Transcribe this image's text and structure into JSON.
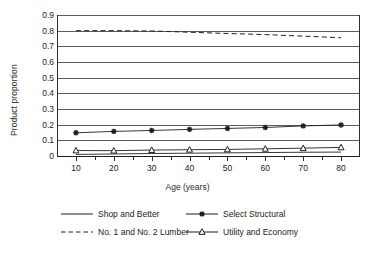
{
  "chart_data": {
    "type": "line",
    "title": "",
    "xlabel": "Age (years)",
    "ylabel": "Product proportion",
    "x": [
      10,
      20,
      30,
      40,
      50,
      60,
      70,
      80
    ],
    "xlim": [
      5,
      85
    ],
    "ylim": [
      0,
      0.9
    ],
    "xticks": [
      "10",
      "20",
      "30",
      "40",
      "50",
      "60",
      "70",
      "80"
    ],
    "yticks": [
      "0",
      "0.1",
      "0.2",
      "0.3",
      "0.4",
      "0.5",
      "0.6",
      "0.7",
      "0.8",
      "0.9"
    ],
    "grid": "horizontal",
    "legend_position": "bottom",
    "series": [
      {
        "name": "Shop and Better",
        "style": "solid",
        "marker": "none",
        "values": [
          0.01,
          0.013,
          0.016,
          0.018,
          0.02,
          0.022,
          0.024,
          0.025
        ]
      },
      {
        "name": "Select Structural",
        "style": "solid",
        "marker": "star",
        "values": [
          0.148,
          0.157,
          0.163,
          0.17,
          0.176,
          0.182,
          0.192,
          0.198
        ]
      },
      {
        "name": "No. 1 and No. 2 Lumber",
        "style": "dashed",
        "marker": "none",
        "values": [
          0.8,
          0.8,
          0.798,
          0.79,
          0.782,
          0.775,
          0.765,
          0.755
        ]
      },
      {
        "name": "Utility and Economy",
        "style": "solid",
        "marker": "triangle",
        "values": [
          0.035,
          0.034,
          0.038,
          0.04,
          0.042,
          0.046,
          0.05,
          0.055
        ]
      }
    ]
  },
  "legend": {
    "items": [
      {
        "label": "Shop and Better",
        "sample": "solid-line-sample"
      },
      {
        "label": "Select Structural",
        "sample": "solid-line-star-sample"
      },
      {
        "label": "No. 1 and No. 2 Lumber",
        "sample": "dashed-line-sample"
      },
      {
        "label": "Utility and Economy",
        "sample": "solid-line-triangle-sample"
      }
    ]
  },
  "colors": {
    "line": "#1f1f1f",
    "grid": "#5c5c5c",
    "axis": "#2e2e2e",
    "text": "#232323",
    "background": "#ffffff"
  }
}
